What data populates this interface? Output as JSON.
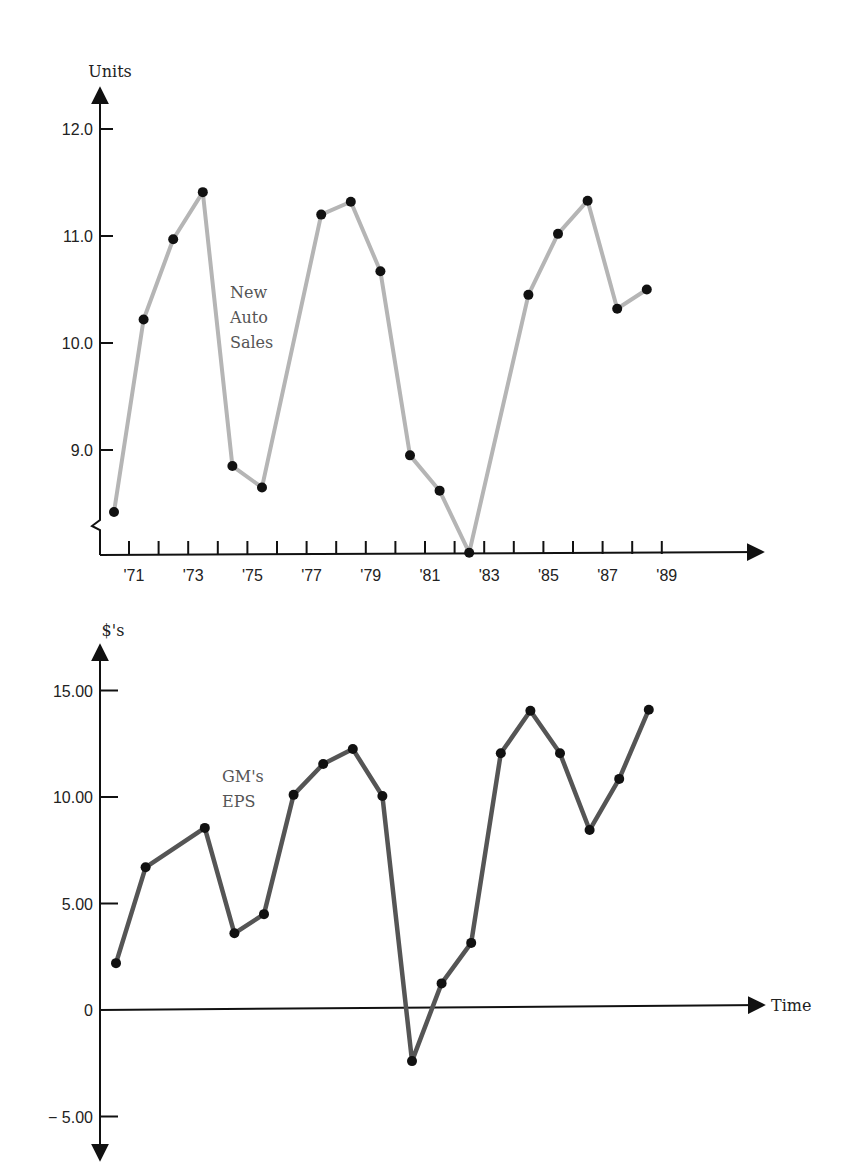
{
  "chart_data": [
    {
      "type": "line",
      "title": "",
      "xlabel": "",
      "ylabel": "Units",
      "annotation": "New Auto Sales",
      "annotation_lines": [
        "New",
        "Auto",
        "Sales"
      ],
      "ylim": [
        8.0,
        12.5
      ],
      "y_axis_break": true,
      "y_ticks": [
        12.0,
        11.0,
        10.0,
        9.0
      ],
      "y_tick_labels": [
        "12.0",
        "11.0",
        "10.0",
        "9.0"
      ],
      "x_tick_labels": [
        "'71",
        "'73",
        "'75",
        "'77",
        "'79",
        "'81",
        "'83",
        "'85",
        "'87",
        "'89"
      ],
      "grid": false,
      "series": [
        {
          "name": "New Auto Sales",
          "color": "#b5b5b5",
          "x": [
            1970,
            1971,
            1972,
            1973,
            1974,
            1975,
            1977,
            1978,
            1979,
            1980,
            1981,
            1982,
            1984,
            1985,
            1986,
            1987,
            1988
          ],
          "values": [
            8.42,
            10.22,
            10.97,
            11.41,
            8.85,
            8.65,
            11.2,
            11.32,
            10.67,
            8.95,
            8.62,
            8.04,
            10.45,
            11.02,
            11.33,
            10.32,
            10.5
          ]
        }
      ]
    },
    {
      "type": "line",
      "title": "",
      "xlabel": "Time",
      "ylabel": "$'s",
      "annotation": "GM's EPS",
      "annotation_lines": [
        "GM's",
        "EPS"
      ],
      "ylim": [
        -7,
        17
      ],
      "y_ticks": [
        15,
        10,
        5,
        0,
        -5
      ],
      "y_tick_labels": [
        "15.00",
        "10.00",
        "5.00",
        "0",
        "− 5.00"
      ],
      "grid": false,
      "series": [
        {
          "name": "GM's EPS",
          "color": "#555555",
          "x": [
            1970,
            1971,
            1973,
            1974,
            1975,
            1976,
            1977,
            1978,
            1979,
            1980,
            1981,
            1982,
            1983,
            1984,
            1985,
            1986,
            1987,
            1988
          ],
          "values": [
            2.2,
            6.7,
            8.55,
            3.6,
            4.5,
            10.1,
            11.55,
            12.25,
            10.05,
            -2.4,
            1.25,
            3.15,
            12.05,
            14.05,
            12.05,
            8.45,
            10.85,
            14.1
          ]
        }
      ]
    }
  ]
}
